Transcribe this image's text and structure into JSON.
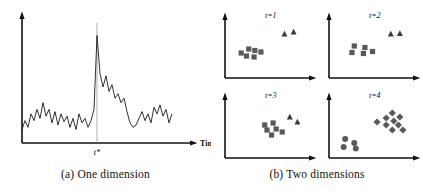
{
  "figure": {
    "panels": [
      {
        "id": "one-dimension",
        "caption": "(a)  One dimension",
        "axis": {
          "xlabel": "Time",
          "event_label": "t*"
        }
      },
      {
        "id": "two-dimensions",
        "caption": "(b)  Two dimensions",
        "subplots": [
          {
            "title": "t=1"
          },
          {
            "title": "t=2"
          },
          {
            "title": "t=3"
          },
          {
            "title": "t=4"
          }
        ]
      }
    ]
  },
  "colors": {
    "axis": "#111111",
    "series": "#1a1a1a",
    "marker_line": "#8a8a8a",
    "square": "#595959",
    "triangle": "#3a3a3a",
    "circle": "#595959",
    "diamond": "#595959",
    "background": "#ffffff"
  },
  "chart_data": [
    {
      "type": "line",
      "id": "one-dimension-timeseries",
      "title": "(a)  One dimension",
      "xlabel": "Time",
      "ylabel": "",
      "grid": false,
      "legend": null,
      "annotations": [
        {
          "text": "t*",
          "x": 50,
          "y": 0,
          "kind": "vertical-marker-label"
        }
      ],
      "xlim": [
        0,
        100
      ],
      "ylim": [
        0,
        100
      ],
      "event_x": 50,
      "x": [
        0,
        2,
        4,
        6,
        8,
        10,
        12,
        14,
        16,
        18,
        20,
        22,
        24,
        26,
        28,
        30,
        32,
        34,
        36,
        38,
        40,
        42,
        44,
        46,
        48,
        50,
        52,
        54,
        56,
        58,
        60,
        62,
        64,
        66,
        68,
        70,
        72,
        74,
        76,
        78,
        80,
        82,
        84,
        86,
        88,
        90,
        92,
        94,
        96,
        98,
        100
      ],
      "y": [
        12,
        20,
        14,
        26,
        20,
        30,
        22,
        36,
        24,
        30,
        18,
        28,
        16,
        26,
        19,
        24,
        14,
        22,
        12,
        26,
        18,
        22,
        14,
        20,
        30,
        96,
        62,
        50,
        60,
        46,
        52,
        40,
        44,
        36,
        40,
        28,
        18,
        14,
        16,
        22,
        28,
        20,
        26,
        18,
        32,
        26,
        34,
        24,
        30,
        18,
        26
      ]
    },
    {
      "type": "scatter",
      "id": "two-dimensions-t1",
      "title": "t=1",
      "xlabel": "",
      "ylabel": "",
      "grid": false,
      "xlim": [
        0,
        100
      ],
      "ylim": [
        0,
        100
      ],
      "series": [
        {
          "name": "squares",
          "marker": "square",
          "points": [
            [
              16,
              42
            ],
            [
              26,
              50
            ],
            [
              23,
              36
            ],
            [
              34,
              47
            ],
            [
              33,
              34
            ],
            [
              42,
              44
            ]
          ]
        },
        {
          "name": "triangles",
          "marker": "triangle",
          "points": [
            [
              73,
              80
            ],
            [
              85,
              84
            ]
          ]
        }
      ]
    },
    {
      "type": "scatter",
      "id": "two-dimensions-t2",
      "title": "t=2",
      "xlabel": "",
      "ylabel": "",
      "grid": false,
      "xlim": [
        0,
        100
      ],
      "ylim": [
        0,
        100
      ],
      "series": [
        {
          "name": "squares",
          "marker": "square",
          "points": [
            [
              28,
              56
            ],
            [
              42,
              53
            ],
            [
              25,
              43
            ],
            [
              40,
              41
            ],
            [
              52,
              45
            ]
          ]
        },
        {
          "name": "triangles",
          "marker": "triangle",
          "points": [
            [
              76,
              80
            ],
            [
              88,
              81
            ]
          ]
        }
      ]
    },
    {
      "type": "scatter",
      "id": "two-dimensions-t3",
      "title": "t=3",
      "xlabel": "",
      "ylabel": "",
      "grid": false,
      "xlim": [
        0,
        100
      ],
      "ylim": [
        0,
        100
      ],
      "series": [
        {
          "name": "squares",
          "marker": "square",
          "points": [
            [
              47,
              58
            ],
            [
              58,
              62
            ],
            [
              50,
              48
            ],
            [
              62,
              50
            ],
            [
              56,
              38
            ],
            [
              70,
              44
            ]
          ]
        },
        {
          "name": "triangles",
          "marker": "triangle",
          "points": [
            [
              80,
              74
            ],
            [
              90,
              64
            ]
          ]
        }
      ]
    },
    {
      "type": "scatter",
      "id": "two-dimensions-t4",
      "title": "t=4",
      "xlabel": "",
      "ylabel": "",
      "grid": false,
      "xlim": [
        0,
        100
      ],
      "ylim": [
        0,
        100
      ],
      "series": [
        {
          "name": "diamonds",
          "marker": "diamond",
          "points": [
            [
              58,
              64
            ],
            [
              70,
              72
            ],
            [
              78,
              82
            ],
            [
              70,
              58
            ],
            [
              80,
              66
            ],
            [
              88,
              74
            ],
            [
              86,
              58
            ],
            [
              78,
              48
            ],
            [
              92,
              48
            ]
          ]
        },
        {
          "name": "circles",
          "marker": "circle",
          "points": [
            [
              16,
              30
            ],
            [
              28,
              22
            ],
            [
              14,
              14
            ],
            [
              30,
              11
            ]
          ]
        }
      ]
    }
  ]
}
